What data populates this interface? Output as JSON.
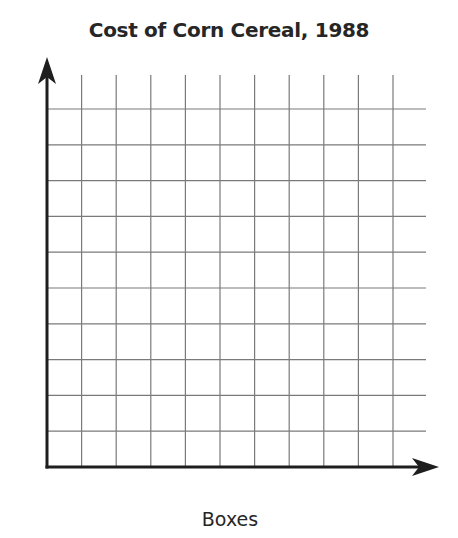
{
  "chart_data": {
    "type": "line",
    "title": "Cost of Corn Cereal, 1988",
    "xlabel": "Boxes",
    "ylabel": "",
    "x_tick_labels": [],
    "y_tick_labels": [],
    "series": [],
    "grid": true,
    "grid_columns": 10,
    "grid_rows": 10,
    "axes_arrows": true,
    "legend": null
  },
  "colors": {
    "axis": "#1e1e1e",
    "grid": "#7a7a7a",
    "text": "#262626"
  }
}
